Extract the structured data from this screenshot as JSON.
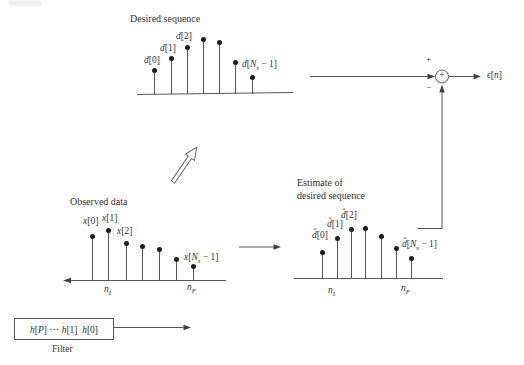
{
  "colors": {
    "background": "#ffffff",
    "ink": "#333333",
    "line": "#575757",
    "dot": "#1d1d1d"
  },
  "panels": {
    "desired": {
      "title": "Desired sequence",
      "stems": {
        "x": [
          154,
          171,
          187,
          203,
          219,
          235,
          252
        ],
        "y": [
          70,
          58,
          47,
          39,
          42,
          62,
          77
        ],
        "axis_y": 94
      },
      "point_labels": [
        {
          "html": "<i>d</i>[0]",
          "x": 144,
          "y": 55
        },
        {
          "html": "<i>d</i>[1]",
          "x": 160,
          "y": 43
        },
        {
          "html": "<i>d</i>[2]",
          "x": 176,
          "y": 31
        },
        {
          "html": "<i>d</i>[<i>N<sub>s</sub></i> − 1]",
          "x": 242,
          "y": 59
        }
      ]
    },
    "observed": {
      "title": "Observed data",
      "stems": {
        "x": [
          92,
          108,
          126,
          142,
          159,
          176,
          193
        ],
        "y": [
          236,
          230,
          243,
          246,
          249,
          259,
          266
        ],
        "axis_y": 280
      },
      "point_labels": [
        {
          "html": "<i>x</i>[0]",
          "x": 83,
          "y": 216
        },
        {
          "html": "<i>x</i>[1]",
          "x": 102,
          "y": 213
        },
        {
          "html": "<i>x</i>[2]",
          "x": 117,
          "y": 226
        },
        {
          "html": "<i>x</i>[<i>N<sub>s</sub></i> − 1]",
          "x": 184,
          "y": 252
        }
      ],
      "axis_labels": {
        "left": "<i>n<sub>I</sub></i>",
        "right": "<i>n<sub>F</sub></i>"
      }
    },
    "estimate": {
      "title_line1": "Estimate of",
      "title_line2": "desired sequence",
      "stems": {
        "x": [
          322,
          337,
          351,
          365,
          381,
          396,
          411
        ],
        "y": [
          252,
          238,
          229,
          228,
          236,
          248,
          258
        ],
        "axis_y": 278
      },
      "point_labels": [
        {
          "html": "<i>d̂</i>[0]",
          "x": 312,
          "y": 230
        },
        {
          "html": "<i>d̂</i>[1]",
          "x": 327,
          "y": 219
        },
        {
          "html": "<i>d̂</i>[2]",
          "x": 341,
          "y": 210
        },
        {
          "html": "<i>d̂</i>[<i>N<sub>s</sub></i> − 1]",
          "x": 402,
          "y": 239
        }
      ],
      "axis_labels": {
        "left": "<i>n<sub>I</sub></i>",
        "right": "<i>n<sub>F</sub></i>"
      }
    }
  },
  "summation": {
    "plus_sign": "+",
    "minus_sign": "−",
    "node_symbol": "+",
    "output_label": "<i>ϵ</i>[<i>n</i>]"
  },
  "filter": {
    "box_label": "<i>h</i>[<i>P</i>] ⋯ <i>h</i>[1]&nbsp; <i>h</i>[0]",
    "caption": "Filter"
  }
}
